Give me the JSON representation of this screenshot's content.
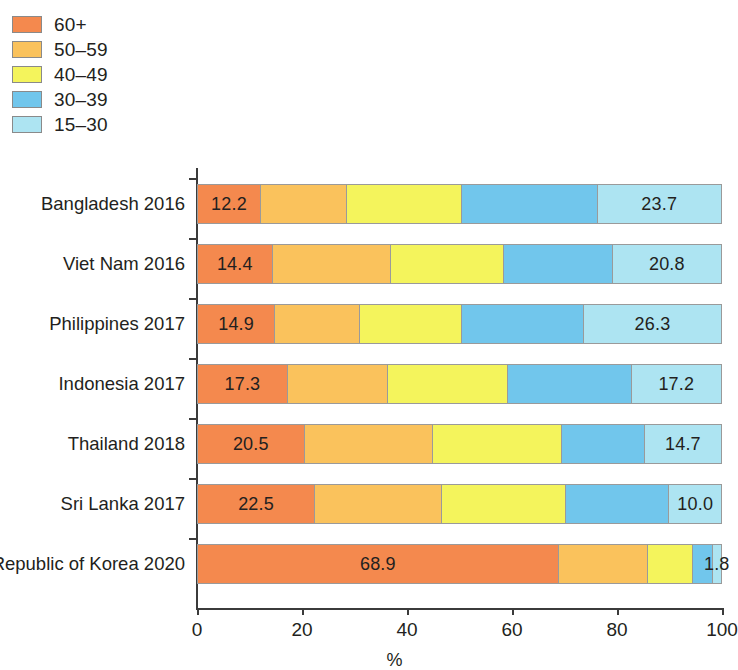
{
  "legend": {
    "position": "top-left",
    "items": [
      {
        "label": "60+",
        "color": "#F4894E"
      },
      {
        "label": "50–59",
        "color": "#FAC25C"
      },
      {
        "label": "40–49",
        "color": "#F4F45C"
      },
      {
        "label": "30–39",
        "color": "#71C6EC"
      },
      {
        "label": "15–30",
        "color": "#ADE4F2"
      }
    ]
  },
  "axis": {
    "x_title": "%",
    "x_ticks": [
      "0",
      "20",
      "40",
      "60",
      "80",
      "100"
    ],
    "x_tick_values": [
      0,
      20,
      40,
      60,
      80,
      100
    ]
  },
  "chart_data": {
    "type": "bar",
    "orientation": "horizontal",
    "stacked": true,
    "normalized": true,
    "title": "",
    "xlabel": "%",
    "ylabel": "",
    "xlim": [
      0,
      100
    ],
    "grid": false,
    "legend_position": "top-left",
    "categories": [
      "Bangladesh 2016",
      "Viet Nam 2016",
      "Philippines 2017",
      "Indonesia 2017",
      "Thailand 2018",
      "Sri Lanka 2017",
      "Republic of Korea 2020"
    ],
    "series": [
      {
        "name": "60+",
        "color": "#F4894E",
        "values": [
          12.2,
          14.4,
          14.9,
          17.3,
          20.5,
          22.5,
          68.9
        ]
      },
      {
        "name": "50–59",
        "color": "#FAC25C",
        "values": [
          16.3,
          22.6,
          16.1,
          19.1,
          24.5,
          24.2,
          17.1
        ]
      },
      {
        "name": "40–49",
        "color": "#F4F45C",
        "values": [
          22.0,
          21.4,
          19.5,
          22.8,
          24.5,
          23.6,
          8.5
        ]
      },
      {
        "name": "30–39",
        "color": "#71C6EC",
        "values": [
          25.8,
          20.8,
          23.2,
          23.6,
          15.8,
          19.7,
          3.7
        ]
      },
      {
        "name": "15–30",
        "color": "#ADE4F2",
        "values": [
          23.7,
          20.8,
          26.3,
          17.2,
          14.7,
          10.0,
          1.8
        ]
      }
    ],
    "value_labels": {
      "shown_for_series": [
        "60+",
        "15–30"
      ],
      "60+": [
        "12.2",
        "14.4",
        "14.9",
        "17.3",
        "20.5",
        "22.5",
        "68.9"
      ],
      "15–30": [
        "23.7",
        "20.8",
        "26.3",
        "17.2",
        "14.7",
        "10.0",
        "1.8"
      ]
    }
  }
}
